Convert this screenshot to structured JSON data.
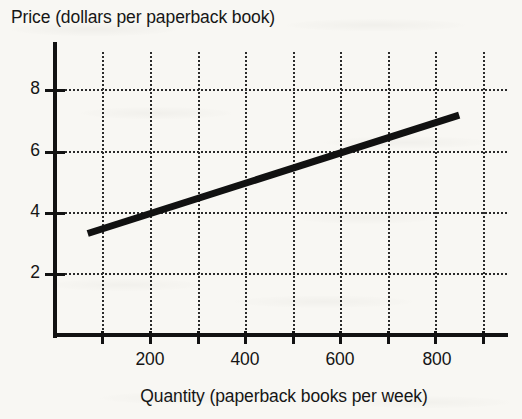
{
  "figure": {
    "width": 522,
    "height": 419,
    "background_color": "#f8f7f3",
    "ink_color": "#121212"
  },
  "chart_data": {
    "type": "line",
    "title": "",
    "subtitle": "",
    "xlabel": "Quantity (paperback books per week)",
    "ylabel": "Price (dollars per paperback book)",
    "xlim": [
      0,
      950
    ],
    "ylim": [
      0,
      9.2
    ],
    "grid": true,
    "grid_style": "dotted",
    "legend": "none",
    "xticks": [
      100,
      200,
      300,
      400,
      500,
      600,
      700,
      800,
      900
    ],
    "xticklabels": [
      "",
      "200",
      "",
      "400",
      "",
      "600",
      "",
      "800",
      ""
    ],
    "yticks": [
      2,
      4,
      6,
      8
    ],
    "yticklabels": [
      "2",
      "4",
      "6",
      "8"
    ],
    "series": [
      {
        "name": "supply",
        "color": "#111111",
        "linewidth": 7,
        "x": [
          70,
          850
        ],
        "y": [
          3.3,
          7.15
        ],
        "slope_per_unit": 0.004936,
        "intercept": 2.955,
        "reference_points": [
          {
            "x": 200,
            "y": 3.94
          },
          {
            "x": 400,
            "y": 4.93
          },
          {
            "x": 600,
            "y": 5.92
          },
          {
            "x": 800,
            "y": 6.9
          }
        ]
      }
    ],
    "annotations": []
  },
  "axes": {
    "y_title": "Price (dollars per paperback book)",
    "x_title": "Quantity (paperback books per week)",
    "y_tick_labels": [
      {
        "value": 8,
        "label": "8"
      },
      {
        "value": 6,
        "label": "6"
      },
      {
        "value": 4,
        "label": "4"
      },
      {
        "value": 2,
        "label": "2"
      }
    ],
    "x_tick_labels": [
      {
        "value": 200,
        "label": "200"
      },
      {
        "value": 400,
        "label": "400"
      },
      {
        "value": 600,
        "label": "600"
      },
      {
        "value": 800,
        "label": "800"
      }
    ]
  }
}
